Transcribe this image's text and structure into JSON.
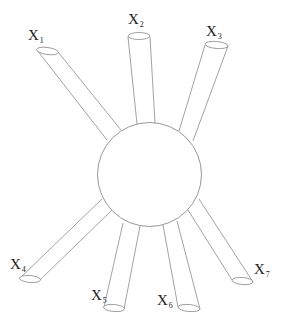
{
  "diagram": {
    "type": "hub-and-spoke",
    "hub": {
      "shape": "circle",
      "cx": 149.5,
      "cy": 174.5,
      "r": 52
    },
    "stroke_color": "#8a8a8a",
    "label_color": "#222222",
    "spokes": [
      {
        "id": "x1",
        "label": "X",
        "sub": "1",
        "lx": 28,
        "ly": 28,
        "end": {
          "cx": 47.5,
          "cy": 51,
          "rx": 11,
          "ry": 3.5,
          "rot": 8
        },
        "a1": [
          37,
          50
        ],
        "a2": [
          58,
          52
        ],
        "b1": [
          107,
          140
        ],
        "b2": [
          121,
          130
        ]
      },
      {
        "id": "x2",
        "label": "X",
        "sub": "2",
        "lx": 128,
        "ly": 12,
        "end": {
          "cx": 139,
          "cy": 36,
          "rx": 11,
          "ry": 3.5,
          "rot": 0
        },
        "a1": [
          128,
          37
        ],
        "a2": [
          150,
          37
        ],
        "b1": [
          137,
          124
        ],
        "b2": [
          155,
          123
        ]
      },
      {
        "id": "x3",
        "label": "X",
        "sub": "3",
        "lx": 206,
        "ly": 24,
        "end": {
          "cx": 216.5,
          "cy": 45,
          "rx": 11.5,
          "ry": 3.5,
          "rot": 5
        },
        "a1": [
          205,
          45
        ],
        "a2": [
          228,
          46
        ],
        "b1": [
          179,
          131
        ],
        "b2": [
          193,
          141
        ]
      },
      {
        "id": "x4",
        "label": "X",
        "sub": "4",
        "lx": 10,
        "ly": 257,
        "end": {
          "cx": 30,
          "cy": 279,
          "rx": 10.5,
          "ry": 3.5,
          "rot": 5
        },
        "a1": [
          20,
          278
        ],
        "a2": [
          40,
          280
        ],
        "b1": [
          102,
          199
        ],
        "b2": [
          112,
          210
        ]
      },
      {
        "id": "x5",
        "label": "X",
        "sub": "5",
        "lx": 91,
        "ly": 288,
        "end": {
          "cx": 114,
          "cy": 308,
          "rx": 10.5,
          "ry": 3.5,
          "rot": 5
        },
        "a1": [
          104,
          307
        ],
        "a2": [
          124,
          309
        ],
        "b1": [
          123,
          223
        ],
        "b2": [
          140,
          226
        ]
      },
      {
        "id": "x6",
        "label": "X",
        "sub": "6",
        "lx": 157,
        "ly": 293,
        "end": {
          "cx": 189,
          "cy": 308,
          "rx": 11,
          "ry": 3.5,
          "rot": 5
        },
        "a1": [
          178,
          307
        ],
        "a2": [
          200,
          309
        ],
        "b1": [
          163,
          225
        ],
        "b2": [
          177,
          221
        ]
      },
      {
        "id": "x7",
        "label": "X",
        "sub": "7",
        "lx": 254,
        "ly": 262,
        "end": {
          "cx": 242.5,
          "cy": 281,
          "rx": 10.5,
          "ry": 3.5,
          "rot": 5
        },
        "a1": [
          232,
          280
        ],
        "a2": [
          253,
          282
        ],
        "b1": [
          188,
          210
        ],
        "b2": [
          199,
          199
        ]
      }
    ]
  },
  "labels": {
    "x1": {
      "main": "X",
      "sub": "1"
    },
    "x2": {
      "main": "X",
      "sub": "2"
    },
    "x3": {
      "main": "X",
      "sub": "3"
    },
    "x4": {
      "main": "X",
      "sub": "4"
    },
    "x5": {
      "main": "X",
      "sub": "5"
    },
    "x6": {
      "main": "X",
      "sub": "6"
    },
    "x7": {
      "main": "X",
      "sub": "7"
    }
  }
}
